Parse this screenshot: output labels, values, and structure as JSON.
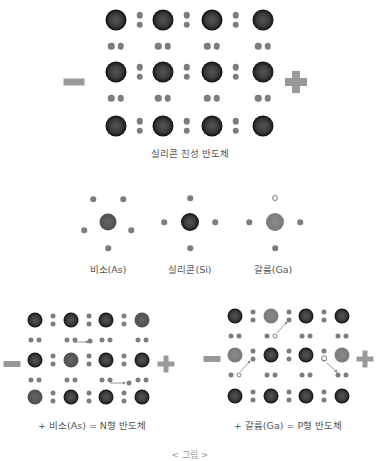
{
  "intrinsic": {
    "caption": "실리콘 진성 반도체"
  },
  "atoms": {
    "as_label": "비소(As)",
    "si_label": "실리콘(Si)",
    "ga_label": "갈륨(Ga)"
  },
  "n_type": {
    "caption": "+ 비소(As) = N형 반도체"
  },
  "p_type": {
    "caption": "+ 갈륨(Ga) = P형 반도체"
  },
  "footer": {
    "caption": "< 그림 >"
  },
  "colors": {
    "silicon": "#111111",
    "arsenic": "#4e4e4e",
    "gallium": "#7a7a7a",
    "electron": "#7d7d7d",
    "terminal": "#999999"
  }
}
